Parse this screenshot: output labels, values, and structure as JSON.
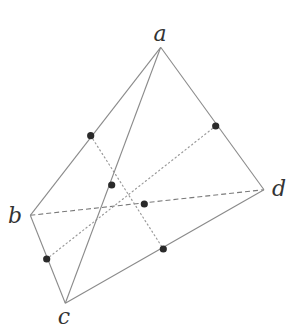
{
  "figure": {
    "vertices": {
      "a": {
        "label": "a",
        "x": 160.7,
        "y": 47.3,
        "label_x": 160,
        "label_y": 41
      },
      "b": {
        "label": "b",
        "x": 30.3,
        "y": 215.3,
        "label_x": 15,
        "label_y": 223
      },
      "c": {
        "label": "c",
        "x": 65.3,
        "y": 303.3,
        "label_x": 64,
        "label_y": 324
      },
      "d": {
        "label": "d",
        "x": 264.0,
        "y": 189.7,
        "label_x": 279,
        "label_y": 196
      }
    },
    "visible_edges": [
      [
        "a",
        "b"
      ],
      [
        "a",
        "c"
      ],
      [
        "a",
        "d"
      ],
      [
        "b",
        "c"
      ],
      [
        "c",
        "d"
      ]
    ],
    "hidden_edges": [
      [
        "b",
        "d"
      ]
    ],
    "midpoints": {
      "ab": {
        "x": 90.7,
        "y": 135.7
      },
      "ac": {
        "x": 111.7,
        "y": 185.0
      },
      "ad": {
        "x": 215.7,
        "y": 126.0
      },
      "bc": {
        "x": 46.7,
        "y": 259.0
      },
      "bd": {
        "x": 144.3,
        "y": 204.0
      },
      "cd": {
        "x": 163.3,
        "y": 249.0
      }
    },
    "bimedians_dotted": [
      [
        "ab",
        "cd"
      ],
      [
        "ad",
        "bc"
      ]
    ],
    "colors": {
      "edge": "#8a8a8a",
      "point": "#2a2a2a",
      "label": "#333333"
    }
  }
}
